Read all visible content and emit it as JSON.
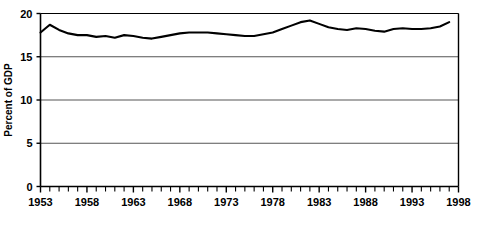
{
  "chart_data": {
    "type": "line",
    "title": "",
    "subtitle": "",
    "xlabel": "",
    "ylabel": "Percent of GDP",
    "xlim": [
      1953,
      1998
    ],
    "ylim": [
      0,
      20
    ],
    "ytick_labels": [
      "0",
      "5",
      "10",
      "15",
      "20"
    ],
    "ytick_values": [
      0,
      5,
      10,
      15,
      20
    ],
    "xtick_labels": [
      "1953",
      "1958",
      "1963",
      "1968",
      "1973",
      "1978",
      "1983",
      "1988",
      "1993",
      "1998"
    ],
    "xtick_values": [
      1953,
      1958,
      1963,
      1968,
      1973,
      1978,
      1983,
      1988,
      1993,
      1998
    ],
    "x_minor_tick_interval": 1,
    "grid": "horizontal",
    "grid_color": "#555555",
    "line_color": "#000000",
    "line_width": 2.1,
    "axis_color": "#000000",
    "background_color": "#ffffff",
    "legend": null,
    "legend_position": "none",
    "annotations": [],
    "x": [
      1953,
      1954,
      1955,
      1956,
      1957,
      1958,
      1959,
      1960,
      1961,
      1962,
      1963,
      1964,
      1965,
      1966,
      1967,
      1968,
      1969,
      1970,
      1971,
      1972,
      1973,
      1974,
      1975,
      1976,
      1977,
      1978,
      1979,
      1980,
      1981,
      1982,
      1983,
      1984,
      1985,
      1986,
      1987,
      1988,
      1989,
      1990,
      1991,
      1992,
      1993,
      1994,
      1995,
      1996,
      1997
    ],
    "values": [
      17.8,
      18.7,
      18.1,
      17.7,
      17.5,
      17.5,
      17.3,
      17.4,
      17.2,
      17.5,
      17.4,
      17.2,
      17.1,
      17.3,
      17.5,
      17.7,
      17.8,
      17.8,
      17.8,
      17.7,
      17.6,
      17.5,
      17.4,
      17.4,
      17.6,
      17.8,
      18.2,
      18.6,
      19.0,
      19.2,
      18.8,
      18.4,
      18.2,
      18.1,
      18.3,
      18.2,
      18.0,
      17.9,
      18.2,
      18.3,
      18.2,
      18.2,
      18.3,
      18.5,
      19.0
    ]
  }
}
